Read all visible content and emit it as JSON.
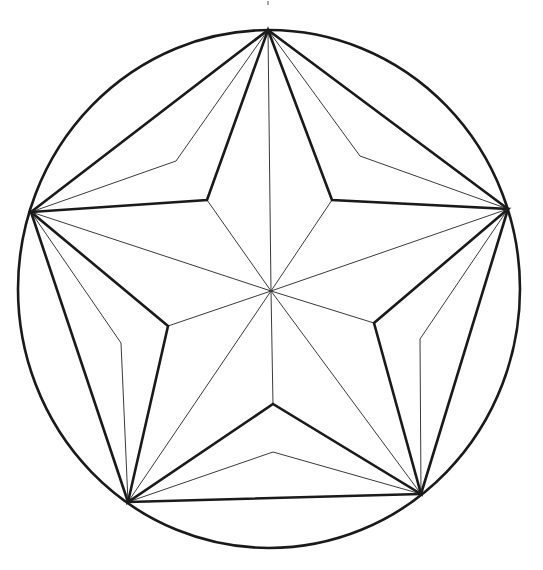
{
  "diagram": {
    "title": "",
    "type": "five-pointed star inscribed in circle with construction lines",
    "canvas": {
      "width": 543,
      "height": 570
    },
    "colors": {
      "background": "#ffffff",
      "thick_stroke": "#1a1a1a",
      "thin_stroke": "#3a3a3a"
    },
    "circle": {
      "cx": 269,
      "cy": 289,
      "rx": 251,
      "ry": 259
    },
    "center": {
      "x": 271,
      "y": 291
    },
    "outer_points": [
      {
        "name": "top",
        "x": 268,
        "y": 30
      },
      {
        "name": "right",
        "x": 508,
        "y": 209
      },
      {
        "name": "bottom-right",
        "x": 421,
        "y": 494
      },
      {
        "name": "bottom-left",
        "x": 128,
        "y": 502
      },
      {
        "name": "left",
        "x": 31,
        "y": 212
      }
    ],
    "inner_points": [
      {
        "name": "upper-right",
        "x": 332,
        "y": 200
      },
      {
        "name": "lower-right",
        "x": 374,
        "y": 323
      },
      {
        "name": "bottom",
        "x": 273,
        "y": 404
      },
      {
        "name": "lower-left",
        "x": 168,
        "y": 326
      },
      {
        "name": "upper-left",
        "x": 207,
        "y": 200
      }
    ],
    "kink_points": [
      {
        "name": "upper-right",
        "x": 360,
        "y": 156
      },
      {
        "name": "right",
        "x": 420,
        "y": 339
      },
      {
        "name": "bottom",
        "x": 273,
        "y": 452
      },
      {
        "name": "left",
        "x": 121,
        "y": 343
      },
      {
        "name": "upper-left",
        "x": 176,
        "y": 161
      }
    ],
    "top_mark": {
      "x": 268,
      "y1": 1,
      "y2": 5
    }
  }
}
